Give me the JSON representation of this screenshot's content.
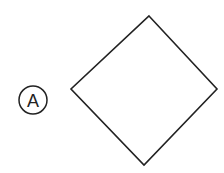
{
  "diagram": {
    "label": {
      "text": "A",
      "shape": "circle",
      "cx": 33,
      "cy": 100,
      "r": 14
    },
    "shape": {
      "type": "diamond",
      "vertices": {
        "top": [
          149,
          16
        ],
        "right": [
          217,
          89
        ],
        "bottom": [
          144,
          165
        ],
        "left": [
          71,
          89
        ]
      }
    },
    "colors": {
      "stroke": "#222222",
      "background": "#ffffff"
    }
  }
}
